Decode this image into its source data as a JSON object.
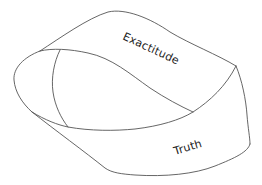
{
  "diagram": {
    "type": "mobius-strip",
    "labels": {
      "top_band": "Exactitude",
      "bottom_band": "Truth"
    },
    "colors": {
      "stroke": "#555555",
      "text": "#1a1a1a",
      "background": "#ffffff"
    }
  }
}
